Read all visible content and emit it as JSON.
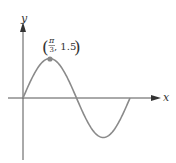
{
  "chart_data": {
    "type": "line",
    "title": "",
    "function": "y = 1.5 sin(3x/2)",
    "xlabel": "x",
    "ylabel": "y",
    "series": [
      {
        "name": "curve",
        "x": [
          0,
          0.5236,
          1.0472,
          1.5708,
          2.0944,
          2.618,
          3.1416,
          3.6652,
          4.1888
        ],
        "values": [
          0,
          1.06,
          1.5,
          1.06,
          0,
          -1.06,
          -1.5,
          -1.06,
          0
        ]
      }
    ],
    "annotations": [
      {
        "label": "(π/3, 1.5)",
        "x": 1.0472,
        "y": 1.5,
        "marker": "dot"
      }
    ],
    "grid": false,
    "legend": "none"
  },
  "labels": {
    "y_axis": "y",
    "x_axis": "x",
    "point_num": "π",
    "point_den": "3",
    "point_y": ", 1.5"
  },
  "colors": {
    "curve": "#8a8a8a",
    "axis": "#444444",
    "point": "#888888"
  }
}
